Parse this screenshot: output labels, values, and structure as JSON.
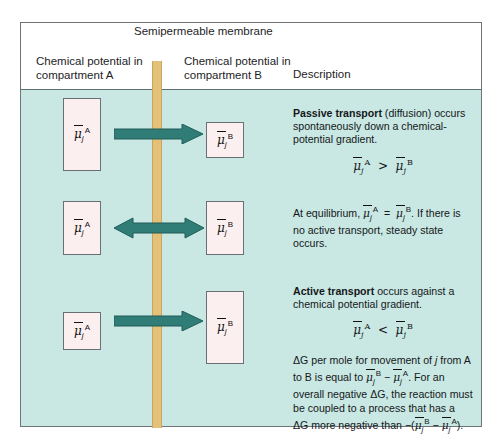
{
  "figure": {
    "membrane_title": "Semipermeable membrane",
    "columns": {
      "compartment_a": "Chemical potential in compartment A",
      "compartment_b": "Chemical potential in compartment B",
      "description": "Description"
    },
    "colors": {
      "background": "#c9e7e3",
      "membrane": "#e3c178",
      "arrow": "#2f7d76",
      "box_fill": "#fbeff0",
      "box_border": "#6a6f73",
      "frame": "#6f7478"
    },
    "symbols": {
      "mu": "μ",
      "subscript_j": "j",
      "superscript_a": "A",
      "superscript_b": "B",
      "greater_than": ">",
      "less_than": "<",
      "equals": "=",
      "delta_g": "ΔG"
    },
    "rows": [
      {
        "name": "passive-transport",
        "arrow_direction": "right",
        "box_a_relative_size": "large",
        "box_b_relative_size": "small",
        "label_a": "μ̄jA",
        "label_b": "μ̄jB",
        "description_lead": "Passive transport",
        "description_rest": " (diffusion) occurs spontaneously down a chemical-potential gradient.",
        "equation": "μ̄jA > μ̄jB"
      },
      {
        "name": "equilibrium",
        "arrow_direction": "both",
        "box_a_relative_size": "medium",
        "box_b_relative_size": "medium",
        "label_a": "μ̄jA",
        "label_b": "μ̄jB",
        "description_part1": "At equilibrium, ",
        "description_part2": ". If there is no active transport, steady state occurs.",
        "equation": "μ̄jA = μ̄jB"
      },
      {
        "name": "active-transport",
        "arrow_direction": "right",
        "box_a_relative_size": "small",
        "box_b_relative_size": "large",
        "label_a": "μ̄jA",
        "label_b": "μ̄jB",
        "description_lead": "Active transport",
        "description_rest": " occurs against a chemical potential gradient.",
        "equation": "μ̄jA < μ̄jB"
      }
    ],
    "footnote": {
      "part1": "ΔG per mole for movement of ",
      "italic_j": "j",
      "part2": " from A to B is equal to ",
      "expr1": "μ̄jB − μ̄jA",
      "part3": ". For an overall negative ΔG, the reaction must be coupled to a process that has a ΔG more negative than ",
      "expr2": "−(μ̄jB − μ̄jA)",
      "part4": "."
    }
  }
}
